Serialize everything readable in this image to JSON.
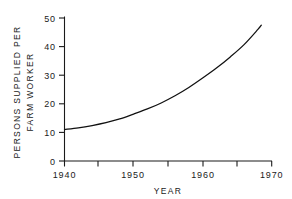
{
  "chart_data": {
    "type": "line",
    "title": "",
    "subtitle": "",
    "xlabel": "YEAR",
    "ylabel_line1": "PERSONS SUPPLIED PER",
    "ylabel_line2": "FARM WORKER",
    "ylabel": "PERSONS SUPPLIED PER FARM WORKER",
    "xlim": [
      1939,
      1970
    ],
    "ylim": [
      0,
      50
    ],
    "grid": false,
    "legend": "none",
    "x_major_ticks": [
      1940,
      1950,
      1960,
      1970
    ],
    "x_major_tick_labels": [
      "1940",
      "1950",
      "1960",
      "1970"
    ],
    "x_minor_ticks": [
      1945,
      1955,
      1965
    ],
    "y_ticks": [
      0,
      10,
      20,
      30,
      40,
      50
    ],
    "y_tick_labels": [
      "0",
      "10",
      "20",
      "30",
      "40",
      "50"
    ],
    "series": [
      {
        "name": "Persons supplied per farm worker",
        "color": "#111111",
        "x": [
          1940,
          1942,
          1944,
          1946,
          1948,
          1950,
          1952,
          1954,
          1956,
          1958,
          1960,
          1962,
          1964,
          1966,
          1968,
          1968.5
        ],
        "values": [
          11.0,
          11.6,
          12.4,
          13.4,
          14.7,
          16.4,
          18.2,
          20.3,
          22.8,
          25.7,
          29.0,
          32.5,
          36.4,
          40.7,
          46.0,
          47.5
        ]
      }
    ],
    "annotations": [],
    "notable_points": [
      {
        "year": 1940,
        "value": 11.0
      },
      {
        "year": 1950,
        "value": 16.4
      },
      {
        "year": 1960,
        "value": 29.0
      },
      {
        "year": 1965,
        "value": 38.2
      },
      {
        "year": 1968.5,
        "value": 47.5
      }
    ]
  },
  "colors": {
    "curve": "#111111",
    "axis": "#1a1a1a",
    "text": "#1a1a1a",
    "background": "#ffffff"
  }
}
